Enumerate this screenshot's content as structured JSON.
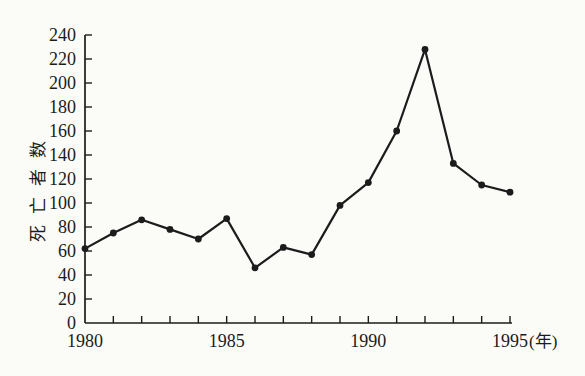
{
  "page": {
    "background_color": "#fbfbf8",
    "ink_color": "#1c1c1c"
  },
  "chart_data": {
    "type": "line",
    "title": "",
    "ylabel": "死亡者数",
    "xlabel": "",
    "x_unit_label": "(年)",
    "x": [
      1980,
      1981,
      1982,
      1983,
      1984,
      1985,
      1986,
      1987,
      1988,
      1989,
      1990,
      1991,
      1992,
      1993,
      1994,
      1995
    ],
    "values": [
      62,
      75,
      86,
      78,
      70,
      87,
      46,
      63,
      57,
      98,
      117,
      160,
      228,
      133,
      115,
      109
    ],
    "ylim": [
      0,
      240
    ],
    "ytick_step": 20,
    "yticks": [
      0,
      20,
      40,
      60,
      80,
      100,
      120,
      140,
      160,
      180,
      200,
      220,
      240
    ],
    "xticks_labeled": [
      1980,
      1985,
      1990,
      1995
    ],
    "grid": false,
    "legend": false,
    "marker": "filled-circle",
    "line_color": "#1c1c1c"
  }
}
